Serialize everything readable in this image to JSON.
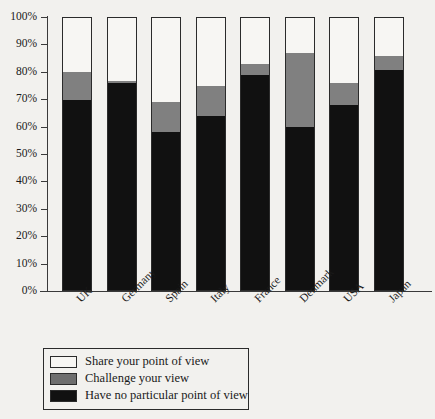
{
  "chart_data": {
    "type": "bar",
    "subtype": "stacked-percentage",
    "title": "",
    "xlabel": "",
    "ylabel": "",
    "ylim": [
      0,
      100
    ],
    "grid": false,
    "legend_position": "bottom-left",
    "categories": [
      "UK",
      "Germany",
      "Spain",
      "Italy",
      "France",
      "Denmark",
      "USA",
      "Japan"
    ],
    "y_ticks": [
      "0%",
      "10%",
      "20%",
      "30%",
      "40%",
      "50%",
      "60%",
      "70%",
      "80%",
      "90%",
      "100%"
    ],
    "series": [
      {
        "name": "Share your point of view",
        "color": "#f7f6f3",
        "values": [
          20,
          23,
          31,
          25,
          17,
          13,
          24,
          14
        ]
      },
      {
        "name": "Challenge your view",
        "color": "#808080",
        "values": [
          10,
          1,
          11,
          11,
          4,
          27,
          8,
          5
        ]
      },
      {
        "name": "Have no particular point of view",
        "color": "#111111",
        "values": [
          70,
          76,
          58,
          64,
          79,
          60,
          68,
          81
        ]
      }
    ]
  },
  "legend": {
    "items": [
      {
        "label": "Share your point of view",
        "swatch": "white-swatch"
      },
      {
        "label": "Challenge your view",
        "swatch": "gray-swatch"
      },
      {
        "label": "Have no particular point of view",
        "swatch": "black-swatch"
      }
    ]
  }
}
